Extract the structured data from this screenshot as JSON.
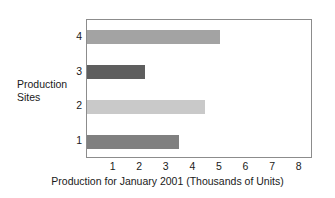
{
  "chart_data": {
    "type": "bar",
    "orientation": "horizontal",
    "title": "",
    "xlabel": "Production for January 2001 (Thousands of Units)",
    "ylabel": "Production\nSites",
    "categories": [
      "1",
      "2",
      "3",
      "4"
    ],
    "values": [
      3.45,
      4.45,
      2.2,
      5.0
    ],
    "bar_colors": [
      "#808080",
      "#c9c9c9",
      "#5e5e5e",
      "#a3a3a3"
    ],
    "xlim": [
      0,
      8.5
    ],
    "xticks": [
      1,
      2,
      3,
      4,
      5,
      6,
      7,
      8
    ],
    "xtick_labels": [
      "1",
      "2",
      "3",
      "4",
      "5",
      "6",
      "7",
      "8"
    ],
    "ytick_labels": [
      "1",
      "2",
      "3",
      "4"
    ],
    "grid": false,
    "legend": "none",
    "frame_color": "#8c8c8c",
    "background": "#ffffff"
  }
}
